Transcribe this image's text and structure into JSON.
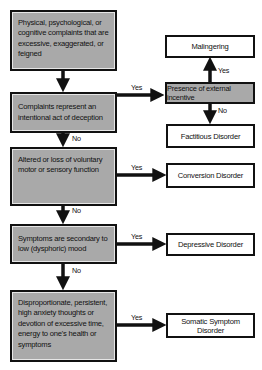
{
  "diagram": {
    "type": "flowchart",
    "decision_nodes": [
      {
        "id": "complaints",
        "text": "Physical, psychological, or cognitive complaints that are excessive, exaggerated, or feigned"
      },
      {
        "id": "deception",
        "text": "Complaints represent an intentional act of deception"
      },
      {
        "id": "motor",
        "text": "Altered or loss of voluntary motor or sensory function"
      },
      {
        "id": "mood",
        "text": "Symptoms are secondary to low (dysphoric) mood"
      },
      {
        "id": "anxiety",
        "text": "Disproportionate, persistent, high anxiety thoughts or devotion of excessive time, energy to one's health or symptoms"
      }
    ],
    "incentive_node": {
      "id": "incentive",
      "text": "Presence of external incentive"
    },
    "outcomes": {
      "malingering": "Malingering",
      "factitious": "Factitious Disorder",
      "conversion": "Conversion Disorder",
      "depressive": "Depressive Disorder",
      "somatic": "Somatic Symptom Disorder"
    },
    "edge_labels": {
      "yes": "Yes",
      "no": "No"
    },
    "edges": [
      {
        "from": "complaints",
        "to": "deception",
        "label": ""
      },
      {
        "from": "deception",
        "to": "incentive",
        "label": "Yes"
      },
      {
        "from": "incentive",
        "to": "malingering",
        "label": "Yes"
      },
      {
        "from": "incentive",
        "to": "factitious",
        "label": "No"
      },
      {
        "from": "deception",
        "to": "motor",
        "label": "No"
      },
      {
        "from": "motor",
        "to": "conversion",
        "label": "Yes"
      },
      {
        "from": "motor",
        "to": "mood",
        "label": "No"
      },
      {
        "from": "mood",
        "to": "depressive",
        "label": "Yes"
      },
      {
        "from": "mood",
        "to": "anxiety",
        "label": "No"
      },
      {
        "from": "anxiety",
        "to": "somatic",
        "label": "Yes"
      }
    ],
    "colors": {
      "decision_fill": "#a9a9a9",
      "outcome_fill": "#ffffff",
      "stroke": "#111111"
    }
  }
}
